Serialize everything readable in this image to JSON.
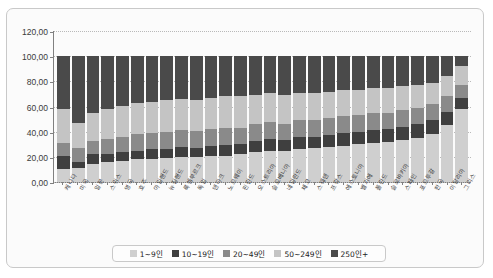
{
  "chart_data": {
    "type": "bar",
    "subtype": "stacked-percentage",
    "title": "",
    "xlabel": "",
    "ylabel": "",
    "ylim": [
      0,
      120
    ],
    "ytick_step": 20,
    "ytick_labels": [
      "0,00",
      "20,00",
      "40,00",
      "60,00",
      "80,00",
      "100,00",
      "120,00"
    ],
    "ytick_values": [
      0,
      20,
      40,
      60,
      80,
      100,
      120
    ],
    "grid": true,
    "legend_position": "bottom",
    "categories": [
      "캐나다",
      "미국",
      "일본",
      "스위스",
      "영국",
      "호주",
      "아일랜드",
      "뉴질랜드",
      "룩셈부르크",
      "독일",
      "덴마크",
      "노르웨이",
      "핀란드",
      "오스트리아",
      "슬로베니아",
      "네덜란드",
      "체코",
      "스웨덴",
      "프랑스",
      "에스토니아",
      "벨기에",
      "폴란드",
      "슬로바키아",
      "스페인",
      "포르투갈",
      "한국",
      "이탈리아",
      "그리스"
    ],
    "series": [
      {
        "name": "1~9인",
        "color": "#cfcfcf",
        "values": [
          10.0,
          11.5,
          14.0,
          16.0,
          17.0,
          18.0,
          18.5,
          19.0,
          20.0,
          19.5,
          21.0,
          21.0,
          22.0,
          24.0,
          25.0,
          24.5,
          26.0,
          27.0,
          28.0,
          29.0,
          30.0,
          31.0,
          32.0,
          33.0,
          35.0,
          38.0,
          45.0,
          58.0
        ]
      },
      {
        "name": "10~19인",
        "color": "#3f3f3f",
        "values": [
          11.0,
          4.5,
          8.0,
          6.0,
          6.5,
          7.0,
          7.5,
          7.0,
          8.0,
          7.5,
          8.0,
          8.5,
          8.0,
          9.0,
          9.5,
          9.0,
          9.5,
          9.0,
          9.5,
          10.0,
          10.0,
          10.5,
          10.0,
          11.0,
          11.0,
          11.0,
          11.0,
          9.0
        ]
      },
      {
        "name": "20~49인",
        "color": "#8a8a8a",
        "values": [
          10.0,
          11.0,
          11.0,
          12.0,
          12.5,
          13.0,
          13.0,
          13.5,
          13.0,
          13.5,
          13.0,
          13.5,
          13.0,
          13.0,
          13.5,
          13.0,
          13.5,
          13.0,
          13.0,
          13.5,
          13.0,
          13.0,
          13.0,
          13.0,
          13.0,
          13.0,
          12.0,
          10.5
        ]
      },
      {
        "name": "50~249인",
        "color": "#c4c4c4",
        "values": [
          27.0,
          20.0,
          22.0,
          24.0,
          24.5,
          25.0,
          25.0,
          25.5,
          25.0,
          25.0,
          25.0,
          25.5,
          25.0,
          23.0,
          23.0,
          23.0,
          22.0,
          22.0,
          21.0,
          21.0,
          20.5,
          20.0,
          19.5,
          19.0,
          18.0,
          17.0,
          16.0,
          14.5
        ]
      },
      {
        "name": "250인+",
        "color": "#4a4a4a",
        "values": [
          42.0,
          53.0,
          45.0,
          42.0,
          39.5,
          37.0,
          36.0,
          35.0,
          34.0,
          34.5,
          33.0,
          31.5,
          32.0,
          31.0,
          29.0,
          30.5,
          29.0,
          29.0,
          28.5,
          26.5,
          26.5,
          25.5,
          25.5,
          24.0,
          23.0,
          21.0,
          16.0,
          8.0
        ]
      }
    ]
  },
  "legend": {
    "items": [
      {
        "label": "1~9인",
        "color": "#cfcfcf"
      },
      {
        "label": "10~19인",
        "color": "#3f3f3f"
      },
      {
        "label": "20~49인",
        "color": "#8a8a8a"
      },
      {
        "label": "50~249인",
        "color": "#c4c4c4"
      },
      {
        "label": "250인+",
        "color": "#4a4a4a"
      }
    ]
  }
}
